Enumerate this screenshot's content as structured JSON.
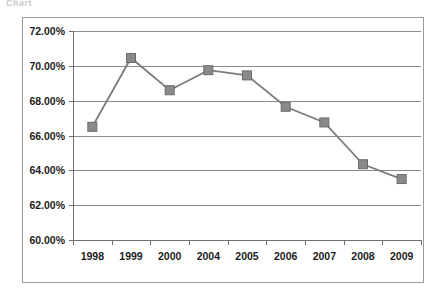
{
  "page": {
    "scan_fragment": "Chart",
    "background_color": "#ffffff",
    "frame_border_color": "#9a9a9a"
  },
  "chart_data": {
    "type": "line",
    "title": "",
    "subtitle": "",
    "xlabel": "",
    "ylabel": "",
    "categories": [
      "1998",
      "1999",
      "2000",
      "2004",
      "2005",
      "2006",
      "2007",
      "2008",
      "2009"
    ],
    "values": [
      66.5,
      70.45,
      68.6,
      69.75,
      69.45,
      67.65,
      66.75,
      64.35,
      63.5
    ],
    "value_labels": [
      "66.50%",
      "70.45%",
      "68.60%",
      "69.75%",
      "69.45%",
      "67.65%",
      "66.75%",
      "64.35%",
      "63.50%"
    ],
    "ylim": [
      60.0,
      72.0
    ],
    "ytick_values": [
      72.0,
      70.0,
      68.0,
      66.0,
      64.0,
      62.0,
      60.0
    ],
    "ytick_labels": [
      "72.00%",
      "70.00%",
      "68.00%",
      "66.00%",
      "64.00%",
      "62.00%",
      "60.00%"
    ],
    "xtick_labels": [
      "1998",
      "1999",
      "2000",
      "2004",
      "2005",
      "2006",
      "2007",
      "2008",
      "2009"
    ],
    "grid": true,
    "grid_axis": "y",
    "legend": false,
    "legend_position": "none",
    "marker": "square",
    "series_color": "#7c7c7c",
    "marker_color": "#8a8a8a",
    "gridline_color": "#8c8c8c",
    "annotations": []
  }
}
